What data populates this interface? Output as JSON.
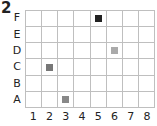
{
  "problem_number": "2",
  "chart_data": {
    "type": "scatter",
    "title": "",
    "x_labels": [
      "1",
      "2",
      "3",
      "4",
      "5",
      "6",
      "7",
      "8"
    ],
    "y_labels": [
      "A",
      "B",
      "C",
      "D",
      "E",
      "F"
    ],
    "grid": true,
    "points": [
      {
        "col": "5",
        "row": "F",
        "color": "#222222"
      },
      {
        "col": "6",
        "row": "D",
        "color": "#aaaaaa"
      },
      {
        "col": "2",
        "row": "C",
        "color": "#777777"
      },
      {
        "col": "3",
        "row": "A",
        "color": "#888888"
      }
    ]
  }
}
